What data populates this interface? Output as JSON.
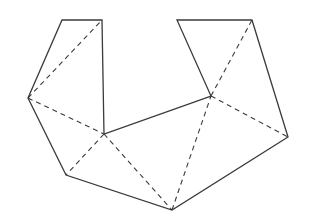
{
  "diagram": {
    "type": "polygon-triangulation",
    "width": 311,
    "height": 223,
    "stroke_color": "#3a3a3a",
    "background": "#ffffff",
    "vertices": {
      "A": [
        62,
        20
      ],
      "B": [
        102,
        20
      ],
      "C": [
        28,
        98
      ],
      "D": [
        104,
        134
      ],
      "E": [
        66,
        175
      ],
      "F": [
        172,
        210
      ],
      "G": [
        288,
        137
      ],
      "H": [
        252,
        20
      ],
      "I": [
        177,
        20
      ],
      "J": [
        211,
        96
      ]
    },
    "boundary": [
      "A",
      "B",
      "D",
      "J",
      "I",
      "H",
      "G",
      "F",
      "E",
      "C"
    ],
    "diagonals": [
      [
        "C",
        "B"
      ],
      [
        "C",
        "D"
      ],
      [
        "D",
        "E"
      ],
      [
        "D",
        "F"
      ],
      [
        "F",
        "J"
      ],
      [
        "J",
        "H"
      ],
      [
        "J",
        "G"
      ]
    ]
  }
}
